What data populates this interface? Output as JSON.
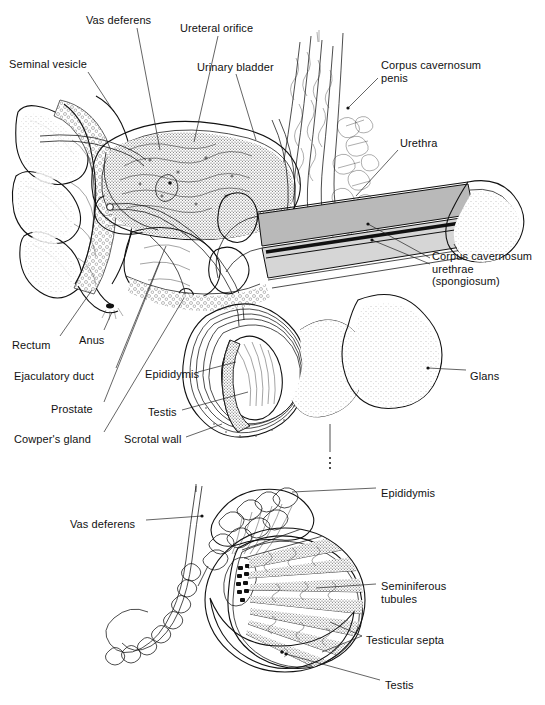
{
  "figure": {
    "title": "",
    "kind": "anatomical-line-drawing",
    "views": [
      {
        "id": "sagittal",
        "name": "midsagittal section of male pelvis and penis"
      },
      {
        "id": "testis-detail",
        "name": "testis and epididymis detail with sagittal cut"
      }
    ],
    "palette": {
      "background": "#ffffff",
      "ink": "#111111",
      "leader_line": "#222222",
      "shaft_fill": "#b9b9b9",
      "shaft_fill_light": "#d6d6d6",
      "urethra_fill": "#1a1a1a",
      "tissue_light": "#f0f0f0",
      "stipple": "#555555"
    }
  },
  "labels_upper": [
    {
      "id": "vas-deferens",
      "text": "Vas deferens",
      "x": 86,
      "y": 14,
      "align": "left"
    },
    {
      "id": "ureteral-orifice",
      "text": "Ureteral orifice",
      "x": 180,
      "y": 22,
      "align": "left"
    },
    {
      "id": "seminal-vesicle",
      "text": "Seminal vesicle",
      "x": 9,
      "y": 58,
      "align": "left"
    },
    {
      "id": "urinary-bladder",
      "text": "Urinary bladder",
      "x": 197,
      "y": 61,
      "align": "left"
    },
    {
      "id": "corpus-cavernosum-penis",
      "text": "Corpus cavernosum\npenis",
      "x": 381,
      "y": 59,
      "align": "left"
    },
    {
      "id": "urethra",
      "text": "Urethra",
      "x": 400,
      "y": 137,
      "align": "left"
    },
    {
      "id": "corpus-cavernosum-urethrae",
      "text": "Corpus cavernosum\nurethrae\n(spongiosum)",
      "x": 432,
      "y": 250,
      "align": "left"
    },
    {
      "id": "rectum",
      "text": "Rectum",
      "x": 12,
      "y": 339,
      "align": "left"
    },
    {
      "id": "anus",
      "text": "Anus",
      "x": 79,
      "y": 334,
      "align": "left"
    },
    {
      "id": "ejaculatory-duct",
      "text": "Ejaculatory duct",
      "x": 14,
      "y": 370,
      "align": "left"
    },
    {
      "id": "epididymis-upper",
      "text": "Epididymis",
      "x": 145,
      "y": 368,
      "align": "left"
    },
    {
      "id": "prostate",
      "text": "Prostate",
      "x": 51,
      "y": 403,
      "align": "left"
    },
    {
      "id": "testis-upper",
      "text": "Testis",
      "x": 148,
      "y": 406,
      "align": "left"
    },
    {
      "id": "glans",
      "text": "Glans",
      "x": 470,
      "y": 370,
      "align": "left"
    },
    {
      "id": "cowpers-gland",
      "text": "Cowper's gland",
      "x": 14,
      "y": 433,
      "align": "left"
    },
    {
      "id": "scrotal-wall",
      "text": "Scrotal wall",
      "x": 124,
      "y": 433,
      "align": "left"
    }
  ],
  "labels_lower": [
    {
      "id": "epididymis-lower",
      "text": "Epididymis",
      "x": 381,
      "y": 487,
      "align": "left"
    },
    {
      "id": "vas-deferens-lower",
      "text": "Vas deferens",
      "x": 70,
      "y": 518,
      "align": "left"
    },
    {
      "id": "seminiferous-tubules",
      "text": "Seminiferous\ntubules",
      "x": 381,
      "y": 580,
      "align": "left"
    },
    {
      "id": "testicular-septa",
      "text": "Testicular septa",
      "x": 366,
      "y": 634,
      "align": "left"
    },
    {
      "id": "testis-lower",
      "text": "Testis",
      "x": 385,
      "y": 679,
      "align": "left"
    }
  ]
}
